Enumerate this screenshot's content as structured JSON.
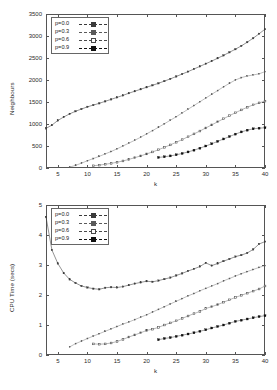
{
  "figure": {
    "width": 277,
    "height": 390,
    "background": "#ffffff",
    "ink": "#2a2a2a"
  },
  "legend": {
    "entries": [
      {
        "label": "p=0.0",
        "marker": "filled-square",
        "color": "#3a3a3a"
      },
      {
        "label": "p=0.3",
        "marker": "small-dot",
        "color": "#5a5a5a"
      },
      {
        "label": "p=0.6",
        "marker": "open-square",
        "color": "#4a4a4a"
      },
      {
        "label": "p=0.9",
        "marker": "bold-square",
        "color": "#111111"
      }
    ],
    "position": "top-left"
  },
  "chart_data": [
    {
      "type": "line",
      "id": "neighbours-vs-k",
      "title": "",
      "xlabel": "k",
      "ylabel": "Neighbours",
      "xlim": [
        3,
        40
      ],
      "ylim": [
        0,
        3500
      ],
      "xticks": [
        5,
        10,
        15,
        20,
        25,
        30,
        35,
        40
      ],
      "yticks": [
        0,
        500,
        1000,
        1500,
        2000,
        2500,
        3000,
        3500
      ],
      "grid": false,
      "legend_position": "top-left",
      "series": [
        {
          "name": "p=0.0",
          "marker": "filled-square",
          "color": "#3a3a3a",
          "x": [
            3,
            4,
            5,
            6,
            7,
            8,
            9,
            10,
            11,
            12,
            13,
            14,
            15,
            16,
            17,
            18,
            19,
            20,
            21,
            22,
            23,
            24,
            25,
            26,
            27,
            28,
            29,
            30,
            31,
            32,
            33,
            34,
            35,
            36,
            37,
            38,
            39,
            40
          ],
          "y": [
            900,
            975,
            1080,
            1160,
            1230,
            1290,
            1340,
            1390,
            1430,
            1470,
            1515,
            1560,
            1605,
            1650,
            1700,
            1745,
            1790,
            1835,
            1880,
            1925,
            1975,
            2025,
            2080,
            2135,
            2190,
            2250,
            2310,
            2370,
            2430,
            2495,
            2560,
            2630,
            2700,
            2775,
            2860,
            2950,
            3050,
            3155
          ]
        },
        {
          "name": "p=0.3",
          "marker": "small-dot",
          "color": "#5a5a5a",
          "x": [
            7,
            8,
            9,
            10,
            11,
            12,
            13,
            14,
            15,
            16,
            17,
            18,
            19,
            20,
            21,
            22,
            23,
            24,
            25,
            26,
            27,
            28,
            29,
            30,
            31,
            32,
            33,
            34,
            35,
            36,
            37,
            38,
            39,
            40
          ],
          "y": [
            20,
            60,
            110,
            165,
            215,
            265,
            320,
            375,
            435,
            500,
            565,
            630,
            700,
            775,
            850,
            925,
            1005,
            1085,
            1165,
            1250,
            1335,
            1420,
            1505,
            1590,
            1675,
            1760,
            1845,
            1925,
            2000,
            2055,
            2090,
            2115,
            2140,
            2190
          ]
        },
        {
          "name": "p=0.6",
          "marker": "open-square",
          "color": "#4a4a4a",
          "x": [
            11,
            12,
            13,
            14,
            15,
            16,
            17,
            18,
            19,
            20,
            21,
            22,
            23,
            24,
            25,
            26,
            27,
            28,
            29,
            30,
            31,
            32,
            33,
            34,
            35,
            36,
            37,
            38,
            39,
            40
          ],
          "y": [
            50,
            65,
            85,
            105,
            130,
            160,
            195,
            235,
            275,
            320,
            365,
            415,
            470,
            525,
            585,
            645,
            710,
            775,
            840,
            910,
            980,
            1050,
            1120,
            1190,
            1255,
            1320,
            1380,
            1435,
            1480,
            1520
          ]
        },
        {
          "name": "p=0.9",
          "marker": "bold-square",
          "color": "#111111",
          "x": [
            22,
            23,
            24,
            25,
            26,
            27,
            28,
            29,
            30,
            31,
            32,
            33,
            34,
            35,
            36,
            37,
            38,
            39,
            40
          ],
          "y": [
            240,
            255,
            275,
            300,
            330,
            365,
            405,
            450,
            500,
            550,
            605,
            660,
            715,
            770,
            820,
            860,
            890,
            905,
            915
          ]
        }
      ]
    },
    {
      "type": "line",
      "id": "cpu-time-vs-k",
      "title": "",
      "xlabel": "k",
      "ylabel": "CPU Time (secs)",
      "xlim": [
        3,
        40
      ],
      "ylim": [
        0,
        5
      ],
      "xticks": [
        5,
        10,
        15,
        20,
        25,
        30,
        35,
        40
      ],
      "yticks": [
        0,
        1,
        2,
        3,
        4,
        5
      ],
      "grid": false,
      "legend_position": "top-left",
      "series": [
        {
          "name": "p=0.0",
          "marker": "filled-square",
          "color": "#3a3a3a",
          "x": [
            3,
            4,
            5,
            6,
            7,
            8,
            9,
            10,
            11,
            12,
            13,
            14,
            15,
            16,
            17,
            18,
            19,
            20,
            21,
            22,
            23,
            24,
            25,
            26,
            27,
            28,
            29,
            30,
            31,
            32,
            33,
            34,
            35,
            36,
            37,
            38,
            39,
            40
          ],
          "y": [
            4.6,
            3.5,
            3.05,
            2.73,
            2.52,
            2.4,
            2.3,
            2.25,
            2.21,
            2.19,
            2.24,
            2.26,
            2.25,
            2.28,
            2.33,
            2.38,
            2.42,
            2.46,
            2.44,
            2.48,
            2.53,
            2.58,
            2.65,
            2.72,
            2.8,
            2.87,
            2.95,
            3.07,
            2.98,
            3.05,
            3.13,
            3.2,
            3.28,
            3.33,
            3.4,
            3.52,
            3.7,
            3.78
          ]
        },
        {
          "name": "p=0.3",
          "marker": "small-dot",
          "color": "#5a5a5a",
          "x": [
            7,
            8,
            9,
            10,
            11,
            12,
            13,
            14,
            15,
            16,
            17,
            18,
            19,
            20,
            21,
            22,
            23,
            24,
            25,
            26,
            27,
            28,
            29,
            30,
            31,
            32,
            33,
            34,
            35,
            36,
            37,
            38,
            39,
            40
          ],
          "y": [
            0.27,
            0.38,
            0.46,
            0.55,
            0.63,
            0.71,
            0.79,
            0.87,
            0.95,
            1.03,
            1.1,
            1.18,
            1.26,
            1.34,
            1.43,
            1.52,
            1.61,
            1.7,
            1.79,
            1.88,
            1.97,
            2.05,
            2.14,
            2.22,
            2.3,
            2.38,
            2.47,
            2.55,
            2.63,
            2.71,
            2.78,
            2.85,
            2.92,
            2.98
          ]
        },
        {
          "name": "p=0.6",
          "marker": "open-square",
          "color": "#4a4a4a",
          "x": [
            11,
            12,
            13,
            14,
            15,
            16,
            17,
            18,
            19,
            20,
            21,
            22,
            23,
            24,
            25,
            26,
            27,
            28,
            29,
            30,
            31,
            32,
            33,
            34,
            35,
            36,
            37,
            38,
            39,
            40
          ],
          "y": [
            0.37,
            0.36,
            0.37,
            0.4,
            0.45,
            0.52,
            0.6,
            0.67,
            0.74,
            0.82,
            0.86,
            0.92,
            1.0,
            1.07,
            1.14,
            1.22,
            1.3,
            1.38,
            1.45,
            1.55,
            1.61,
            1.68,
            1.76,
            1.84,
            1.92,
            1.99,
            2.06,
            2.13,
            2.2,
            2.3
          ]
        },
        {
          "name": "p=0.9",
          "marker": "bold-square",
          "color": "#111111",
          "x": [
            22,
            23,
            24,
            25,
            26,
            27,
            28,
            29,
            30,
            31,
            32,
            33,
            34,
            35,
            36,
            37,
            38,
            39,
            40
          ],
          "y": [
            0.51,
            0.55,
            0.58,
            0.62,
            0.66,
            0.7,
            0.74,
            0.79,
            0.84,
            0.9,
            0.95,
            1.0,
            1.06,
            1.12,
            1.16,
            1.2,
            1.24,
            1.28,
            1.31
          ]
        }
      ]
    }
  ]
}
